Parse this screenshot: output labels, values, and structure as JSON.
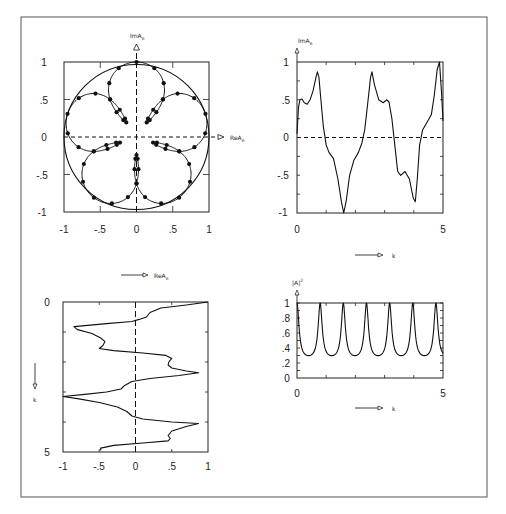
{
  "figure": {
    "panels": [
      {
        "id": "a",
        "xaxis_label": "ReA",
        "xaxis_sub": "e",
        "yaxis_label": "ImA",
        "yaxis_sub": "e",
        "bottom_label": "ReA",
        "bottom_sub": "e"
      },
      {
        "id": "b",
        "yaxis_label": "ImA",
        "yaxis_sub": "e",
        "xaxis_label": "k"
      },
      {
        "id": "c",
        "yaxis_label": "k",
        "xaxis_label": ""
      },
      {
        "id": "d",
        "yaxis_label": "|A|",
        "yaxis_sup": "2",
        "xaxis_label": "k"
      }
    ]
  },
  "chart_data": [
    {
      "type": "line",
      "title": "",
      "xlabel": "ReA_e",
      "ylabel": "ImA_e",
      "xlim": [
        -1,
        1
      ],
      "ylim": [
        -1,
        1
      ],
      "xticks": [
        "-1",
        "-.5",
        "0",
        ".5",
        "1"
      ],
      "yticks": [
        "-1",
        "-.5",
        "0",
        ".5",
        "1"
      ],
      "description": "Parametric curve of complex amplitude A_e in the complex plane with unit circle; 5-fold flower-shaped trajectory with dot markers; dashed axes at 0",
      "series": [
        {
          "name": "unit circle",
          "shape": "circle",
          "radius": 1
        }
      ]
    },
    {
      "type": "line",
      "xlabel": "k",
      "ylabel": "ImA_e",
      "xlim": [
        0,
        5
      ],
      "ylim": [
        -1,
        1
      ],
      "xticks": [
        "0",
        "5"
      ],
      "yticks": [
        "-1",
        "-.5",
        "0",
        ".5",
        "1"
      ],
      "series": [
        {
          "name": "ImA_e",
          "x": [
            0,
            0.05,
            0.1,
            0.17,
            0.25,
            0.35,
            0.45,
            0.55,
            0.65,
            0.7,
            0.75,
            0.82,
            0.9,
            1.0,
            1.1,
            1.25,
            1.4,
            1.52,
            1.6,
            1.68,
            1.8,
            1.95,
            2.1,
            2.22,
            2.32,
            2.42,
            2.52,
            2.57,
            2.65,
            2.8,
            2.95,
            3.08,
            3.15,
            3.25,
            3.35,
            3.45,
            3.55,
            3.7,
            3.85,
            3.98,
            4.05,
            4.12,
            4.2,
            4.3,
            4.45,
            4.6,
            4.7,
            4.8,
            4.88,
            4.95,
            5.0
          ],
          "y": [
            0.05,
            0.4,
            0.5,
            0.51,
            0.46,
            0.44,
            0.5,
            0.62,
            0.8,
            0.87,
            0.8,
            0.5,
            0.15,
            -0.1,
            -0.2,
            -0.28,
            -0.55,
            -0.85,
            -1.0,
            -0.85,
            -0.5,
            -0.3,
            -0.2,
            -0.08,
            0.1,
            0.45,
            0.8,
            0.87,
            0.7,
            0.5,
            0.46,
            0.5,
            0.47,
            0.25,
            -0.1,
            -0.45,
            -0.5,
            -0.45,
            -0.55,
            -0.8,
            -0.85,
            -0.55,
            -0.1,
            0.1,
            0.2,
            0.3,
            0.55,
            0.9,
            1.0,
            0.6,
            0.22
          ]
        }
      ]
    },
    {
      "type": "line",
      "xlabel": "ReA_e",
      "ylabel": "k",
      "xlim": [
        -1,
        1
      ],
      "ylim": [
        5,
        0
      ],
      "xticks": [
        "-1",
        "-.5",
        "0",
        ".5",
        "1"
      ],
      "yticks": [
        "0",
        "5"
      ],
      "series": [
        {
          "name": "ReA_e",
          "k": [
            0,
            0.1,
            0.2,
            0.35,
            0.5,
            0.58,
            0.65,
            0.72,
            0.82,
            0.92,
            1.05,
            1.2,
            1.32,
            1.45,
            1.55,
            1.62,
            1.7,
            1.78,
            1.88,
            2.0,
            2.1,
            2.2,
            2.3,
            2.36,
            2.45,
            2.55,
            2.65,
            2.78,
            2.9,
            3.0,
            3.08,
            3.15,
            3.22,
            3.35,
            3.5,
            3.65,
            3.8,
            3.9,
            4.0,
            4.05,
            4.15,
            4.3,
            4.45,
            4.55,
            4.63,
            4.7,
            4.78,
            4.87,
            4.95
          ],
          "y": [
            1.0,
            0.7,
            0.35,
            0.2,
            0.15,
            0.05,
            -0.05,
            -0.4,
            -0.85,
            -0.8,
            -0.6,
            -0.48,
            -0.42,
            -0.45,
            -0.5,
            -0.3,
            0.1,
            0.42,
            0.5,
            0.46,
            0.45,
            0.5,
            0.7,
            0.87,
            0.6,
            0.2,
            -0.05,
            -0.15,
            -0.2,
            -0.4,
            -0.7,
            -1.0,
            -0.8,
            -0.5,
            -0.25,
            -0.12,
            -0.05,
            0.1,
            0.5,
            0.87,
            0.7,
            0.5,
            0.45,
            0.48,
            0.45,
            0.1,
            -0.3,
            -0.48,
            -0.48
          ]
        }
      ]
    },
    {
      "type": "line",
      "xlabel": "k",
      "ylabel": "|A_e|^2",
      "xlim": [
        0,
        5
      ],
      "ylim": [
        0,
        1
      ],
      "xticks": [
        "0",
        "5"
      ],
      "yticks": [
        "0",
        ".2",
        ".4",
        ".6",
        ".8",
        "1"
      ],
      "series": [
        {
          "name": "|A_e|^2",
          "description": "periodic curve with peaks of 1 and minima of ~0.22",
          "peaks_k": [
            0,
            0.79,
            1.6,
            2.4,
            3.19,
            3.97,
            4.76
          ],
          "min_value": 0.22,
          "max_value": 1.0
        }
      ]
    }
  ]
}
